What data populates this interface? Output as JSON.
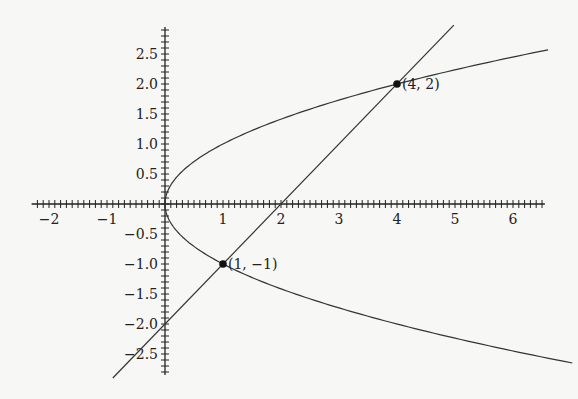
{
  "chart_data": {
    "type": "line",
    "title": "",
    "xlabel": "",
    "ylabel": "",
    "xlim": [
      -2.3,
      6.55
    ],
    "ylim": [
      -2.85,
      2.95
    ],
    "grid": false,
    "x_ticks": [
      -2,
      -1,
      1,
      2,
      3,
      4,
      5,
      6
    ],
    "x_tick_labels": [
      "−2",
      "−1",
      "1",
      "2",
      "3",
      "4",
      "5",
      "6"
    ],
    "y_ticks": [
      2.5,
      2.0,
      1.5,
      1.0,
      0.5,
      -0.5,
      -1.0,
      -1.5,
      -2.0,
      -2.5
    ],
    "y_tick_labels": [
      "2.5",
      "2.0",
      "1.5",
      "1.0",
      "0.5",
      "−0.5",
      "−1.0",
      "−1.5",
      "−2.0",
      "−2.5"
    ],
    "minor_tick_step": 0.1,
    "series": [
      {
        "name": "parabola x = y^2",
        "equation": "x = y^2",
        "y_range": [
          -2.65,
          2.57
        ]
      },
      {
        "name": "line y = x - 2",
        "equation": "y = x - 2",
        "x_range": [
          -0.9,
          4.98
        ]
      }
    ],
    "points": [
      {
        "x": 4,
        "y": 2,
        "label": "(4, 2)"
      },
      {
        "x": 1,
        "y": -1,
        "label": "(1, −1)"
      }
    ],
    "colors": {
      "curve": "#333333",
      "axis": "#222222",
      "point": "#111111"
    }
  }
}
